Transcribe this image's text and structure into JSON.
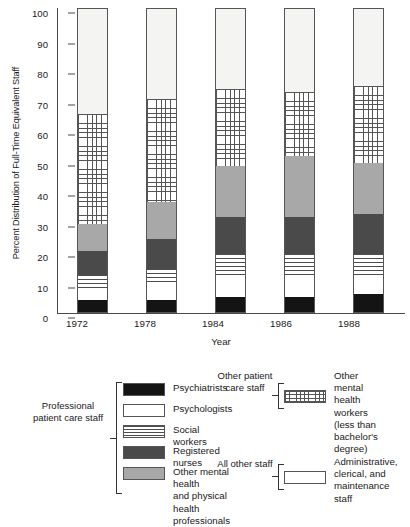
{
  "chart_data": {
    "type": "bar",
    "subtype": "stacked-bar-100",
    "title": "",
    "xlabel": "Year",
    "ylabel": "Percent Distribution of Full-Time Equivalent Staff",
    "categories": [
      "1972",
      "1978",
      "1984",
      "1986",
      "1988"
    ],
    "ylim": [
      0,
      100
    ],
    "yticks": [
      0,
      10,
      20,
      30,
      40,
      50,
      60,
      70,
      80,
      90,
      100
    ],
    "grid": false,
    "legend_position": "below-plot",
    "series": [
      {
        "name": "Psychiatrists",
        "key": "psychiatrists",
        "fill": "solid-black",
        "color": "#141414",
        "values": [
          4,
          4,
          5,
          5,
          6
        ]
      },
      {
        "name": "Psychologists",
        "key": "psychologists",
        "fill": "solid-white",
        "color": "#ffffff",
        "values": [
          4,
          5,
          6,
          7,
          5
        ]
      },
      {
        "name": "Social workers",
        "key": "social_workers",
        "fill": "horizontal-stripes",
        "color": "#ffffff",
        "values": [
          4,
          5,
          8,
          7,
          8
        ]
      },
      {
        "name": "Registered nurses",
        "key": "registered_nurses",
        "fill": "solid-dark-gray",
        "color": "#4a4a4a",
        "values": [
          8,
          10,
          12,
          12,
          13
        ]
      },
      {
        "name": "Other mental health and physical health professionals",
        "key": "other_professionals",
        "fill": "solid-medium-gray",
        "color": "#a8a8a8",
        "values": [
          9,
          12,
          17,
          20,
          17
        ]
      },
      {
        "name": "Other mental health workers (less than bachelor's degree)",
        "key": "other_mh_workers",
        "fill": "cross-hatch-grid",
        "color": "#ffffff",
        "values": [
          36,
          34,
          25,
          21,
          25
        ]
      },
      {
        "name": "Administrative, clerical, and maintenance staff",
        "key": "all_other_staff",
        "fill": "solid-offwhite",
        "color": "#f4f4f2",
        "values": [
          35,
          30,
          27,
          28,
          26
        ]
      }
    ],
    "cumulative_tops": {
      "1972": [
        4,
        8,
        12,
        20,
        29,
        65,
        100
      ],
      "1978": [
        4,
        9,
        14,
        24,
        36,
        70,
        100
      ],
      "1984": [
        5,
        11,
        19,
        31,
        48,
        73,
        100
      ],
      "1986": [
        5,
        12,
        19,
        31,
        51,
        72,
        100
      ],
      "1988": [
        6,
        11,
        19,
        32,
        49,
        74,
        100
      ]
    }
  },
  "axes": {
    "ylabel": "Percent Distribution of Full-Time Equivalent Staff",
    "xlabel": "Year",
    "ytick_labels": [
      "100",
      "90",
      "80",
      "70",
      "60",
      "50",
      "40",
      "30",
      "20",
      "10",
      "0"
    ],
    "xtick_labels": [
      "1972",
      "1978",
      "1984",
      "1986",
      "1988"
    ]
  },
  "legend": {
    "groups": [
      {
        "id": "professional-patient-care-staff",
        "brace_label": "Professional\npatient\ncare\nstaff",
        "items": [
          {
            "label": "Psychiatrists",
            "swatch": "solid-black-swatch"
          },
          {
            "label": "Psychologists",
            "swatch": "solid-white-swatch"
          },
          {
            "label": "Social workers",
            "swatch": "horizontal-stripes-swatch"
          },
          {
            "label": "Registered nurses",
            "swatch": "solid-dark-gray-swatch"
          },
          {
            "label": "Other mental health\nand physical health\nprofessionals",
            "swatch": "solid-medium-gray-swatch"
          }
        ]
      },
      {
        "id": "other-patient-care-staff",
        "brace_label": "Other\npatient\ncare\nstaff",
        "items": [
          {
            "label": "Other mental\nhealth workers\n(less than bachelor's\ndegree)",
            "swatch": "cross-hatch-grid-swatch"
          }
        ]
      },
      {
        "id": "all-other-staff",
        "brace_label": "All\nother\nstaff",
        "items": [
          {
            "label": "Administrative,\nclerical, and\nmaintenance\nstaff",
            "swatch": "solid-white-swatch"
          }
        ]
      }
    ]
  }
}
